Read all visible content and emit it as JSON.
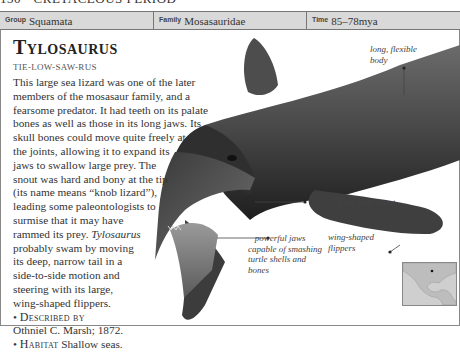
{
  "running_head": {
    "page_number": "130",
    "bullet": "•",
    "section": "CRETACEOUS PERIOD"
  },
  "info_bar": {
    "cells": [
      {
        "label": "Group",
        "value": "Squamata"
      },
      {
        "label": "Family",
        "value": "Mosasauridae"
      },
      {
        "label": "Time",
        "value": "85–78mya"
      }
    ]
  },
  "entry": {
    "title": "Tylosaurus",
    "pronunciation": "TIE-LOW-SAW-RUS",
    "body_lines": [
      "This large sea lizard was one of the later",
      "members of the mosasaur family, and a",
      "fearsome predator. It had teeth on its palate",
      "bones as well as those in its long jaws. Its",
      "skull bones could move quite freely at",
      "the joints, allowing it to expand its",
      "jaws to swallow large prey. The",
      "snout was hard and bony at the tip",
      "(its name means “knob lizard”),",
      "leading some paleontologists to",
      "surmise that it may have",
      "rammed its prey.",
      "probably swam by moving",
      "its deep, narrow tail in a",
      "side-to-side motion and",
      "steering with its large,",
      "wing-shaped flippers."
    ],
    "italic_genus": "Tylosaurus",
    "facts": [
      {
        "key": "Described by",
        "value": "Othniel C. Marsh; 1872."
      },
      {
        "key": "Habitat",
        "value": "Shallow seas."
      }
    ]
  },
  "callouts": [
    {
      "id": "body",
      "lines": [
        "long, flexible",
        "body"
      ]
    },
    {
      "id": "snout",
      "lines": [
        "long, slim snout"
      ]
    },
    {
      "id": "flippers",
      "lines": [
        "wing-shaped",
        "flippers"
      ]
    },
    {
      "id": "jaws",
      "lines": [
        "powerful jaws",
        "capable of smashing",
        "turtle shells and",
        "bones"
      ]
    }
  ],
  "map": {
    "region": "North America / Gulf of Mexico",
    "marker": "fossil-site-dot"
  },
  "colors": {
    "info_bar_bg": "#d9d9d9",
    "rule": "#777777",
    "text": "#333333",
    "illustration_dark": "#2b2b2b"
  }
}
